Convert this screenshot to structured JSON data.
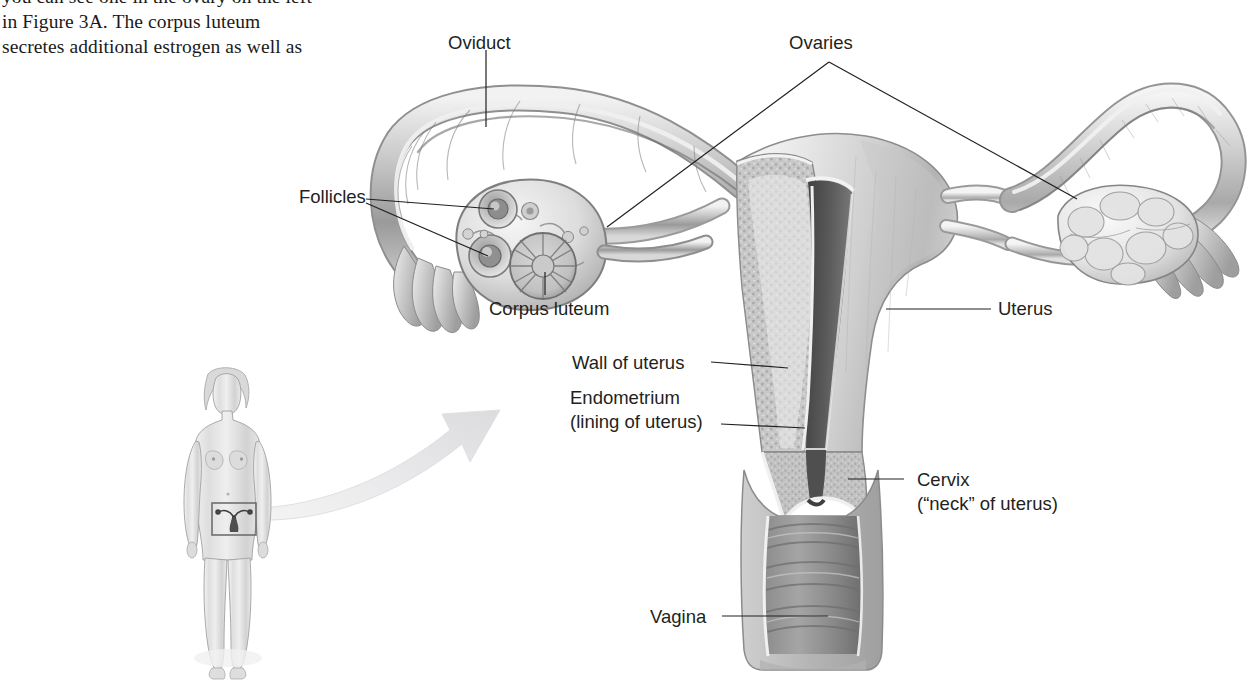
{
  "document": {
    "body_text": {
      "clipped_top_line": "",
      "lines": [
        "you can see one in the ovary on the left",
        "in Figure 3A. The corpus luteum",
        "secretes additional estrogen as well as"
      ]
    }
  },
  "figure": {
    "labels": {
      "oviduct": "Oviduct",
      "ovaries": "Ovaries",
      "follicles": "Follicles",
      "corpus_luteum": "Corpus luteum",
      "uterus": "Uterus",
      "wall_of_uterus": "Wall of uterus",
      "endometrium_line1": "Endometrium",
      "endometrium_line2": "(lining of uterus)",
      "cervix_line1": "Cervix",
      "cervix_line2": "(“neck” of uterus)",
      "vagina": "Vagina"
    },
    "inset": {
      "name": "whole-body figure with pelvic region highlighted",
      "highlight_box": "pelvic region"
    },
    "arrow": {
      "name": "magnification arrow",
      "direction": "up-right"
    }
  },
  "colors": {
    "label_text": "#231f20",
    "body_text": "#1a1a1a",
    "leader_line": "#231f20",
    "arrow_fill": "#e4e4e6",
    "background": "#ffffff",
    "tissue_mid": "#b9b9b9",
    "tissue_light": "#dcdcdc",
    "tissue_dark": "#6e6e6e",
    "cavity_dark": "#4a4a4a"
  }
}
